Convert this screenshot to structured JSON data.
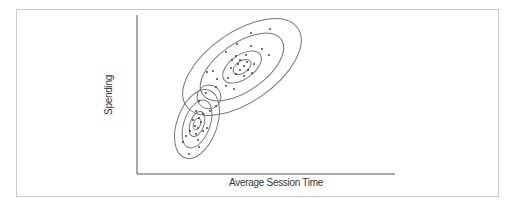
{
  "chart_data": {
    "type": "scatter",
    "title": "",
    "xlabel": "Average Session Time",
    "ylabel": "Spending",
    "grid": false,
    "legend": null,
    "ticks": false,
    "series": [
      {
        "name": "cluster-upper",
        "center": [
          242,
          67
        ],
        "rotation_deg": -35,
        "contours": [
          [
            68,
            35
          ],
          [
            48,
            24
          ],
          [
            22,
            12
          ],
          [
            10,
            6
          ]
        ],
        "points": [
          [
            270,
            29
          ],
          [
            251,
            33
          ],
          [
            237,
            44
          ],
          [
            251,
            46
          ],
          [
            262,
            49
          ],
          [
            226,
            52
          ],
          [
            236,
            56
          ],
          [
            246,
            55
          ],
          [
            232,
            60
          ],
          [
            240,
            60
          ],
          [
            247,
            62
          ],
          [
            254,
            64
          ],
          [
            238,
            64
          ],
          [
            244,
            66
          ],
          [
            231,
            68
          ],
          [
            240,
            70
          ],
          [
            248,
            70
          ],
          [
            236,
            74
          ],
          [
            244,
            76
          ],
          [
            252,
            73
          ],
          [
            228,
            78
          ],
          [
            213,
            71
          ],
          [
            217,
            79
          ],
          [
            226,
            86
          ],
          [
            234,
            89
          ],
          [
            207,
            72
          ],
          [
            216,
            87
          ],
          [
            269,
            55
          ]
        ]
      },
      {
        "name": "cluster-lower",
        "center": [
          197,
          124
        ],
        "rotation_deg": -70,
        "contours": [
          [
            36,
            20
          ],
          [
            25,
            13
          ],
          [
            13,
            7
          ],
          [
            6,
            3.5
          ]
        ],
        "points": [
          [
            206,
            93
          ],
          [
            199,
            101
          ],
          [
            216,
            106
          ],
          [
            196,
            111
          ],
          [
            203,
            114
          ],
          [
            199,
            118
          ],
          [
            193,
            120
          ],
          [
            201,
            122
          ],
          [
            195,
            126
          ],
          [
            198,
            128
          ],
          [
            203,
            131
          ],
          [
            190,
            131
          ],
          [
            196,
            134
          ],
          [
            207,
            128
          ],
          [
            186,
            136
          ],
          [
            198,
            140
          ],
          [
            183,
            142
          ],
          [
            199,
            147
          ],
          [
            189,
            154
          ],
          [
            210,
            111
          ]
        ]
      }
    ],
    "overlap_marker": {
      "center": [
        209,
        97
      ],
      "radius": 12
    }
  }
}
